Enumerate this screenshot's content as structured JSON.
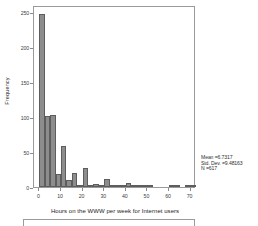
{
  "chart_data": {
    "type": "bar",
    "title": "",
    "subtitle": "",
    "xlabel": "Hours on the WWW per week for Internet users",
    "ylabel": "Frequency",
    "xlim": [
      -2.5,
      72.5
    ],
    "ylim": [
      0,
      260
    ],
    "xticks": [
      "0",
      "10",
      "20",
      "30",
      "40",
      "50",
      "60",
      "70"
    ],
    "xtick_values": [
      0,
      10,
      20,
      30,
      40,
      50,
      60,
      70
    ],
    "yticks": [
      "0",
      "50",
      "100",
      "150",
      "200",
      "250"
    ],
    "ytick_values": [
      0,
      50,
      100,
      150,
      200,
      250
    ],
    "grid": false,
    "legend": null,
    "bin_width": 2.5,
    "bar_color": "#8d8d8d",
    "bar_edge_color": "#5d5d5d",
    "bins": [
      {
        "x": 0.0,
        "value": 247
      },
      {
        "x": 2.5,
        "value": 101
      },
      {
        "x": 5.0,
        "value": 103
      },
      {
        "x": 7.5,
        "value": 19
      },
      {
        "x": 10.0,
        "value": 58
      },
      {
        "x": 12.5,
        "value": 10
      },
      {
        "x": 15.0,
        "value": 20
      },
      {
        "x": 17.5,
        "value": 1
      },
      {
        "x": 20.0,
        "value": 27
      },
      {
        "x": 22.5,
        "value": 3
      },
      {
        "x": 25.0,
        "value": 4
      },
      {
        "x": 27.5,
        "value": 1
      },
      {
        "x": 30.0,
        "value": 11
      },
      {
        "x": 32.5,
        "value": 1
      },
      {
        "x": 35.0,
        "value": 2
      },
      {
        "x": 37.5,
        "value": 3
      },
      {
        "x": 40.0,
        "value": 6
      },
      {
        "x": 42.5,
        "value": 1
      },
      {
        "x": 45.0,
        "value": 2
      },
      {
        "x": 47.5,
        "value": 3
      },
      {
        "x": 50.0,
        "value": 1
      },
      {
        "x": 60.0,
        "value": 1
      },
      {
        "x": 62.5,
        "value": 2
      },
      {
        "x": 67.5,
        "value": 1
      },
      {
        "x": 70.0,
        "value": 2
      }
    ],
    "annotations": {
      "mean_label": "Mean =6.7317",
      "std_dev_label": "Std. Dev. =9.48163",
      "n_label": "N =617",
      "mean": 6.7317,
      "std_dev": 9.48163,
      "n": 617
    }
  }
}
